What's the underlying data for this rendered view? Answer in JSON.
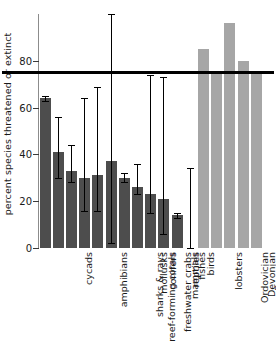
{
  "chart_data": {
    "type": "bar",
    "title": "",
    "xlabel": "",
    "ylabel": "percent species threatened or extinct",
    "ylim": [
      0,
      100
    ],
    "yticks": [
      0,
      20,
      40,
      60,
      80
    ],
    "ytick_labels": [
      "0",
      "20",
      "40",
      "60",
      "80"
    ],
    "grid": false,
    "legend": "none",
    "threshold_line": {
      "value": 75,
      "color": "#000000",
      "label": ""
    },
    "series_colors": {
      "modern_taxa": "#4d4d4d",
      "mass_extinctions": "#a6a6a6"
    },
    "categories": [
      "cycads",
      "amphibians",
      "reef-forming corals",
      "sharks & rays",
      "freshwater crabs",
      "mollusks",
      "conifers",
      "mammals",
      "reptiles",
      "fishes",
      "birds",
      "lobsters",
      "Ordovician",
      "Devonian",
      "Permian",
      "Triassic",
      "Cretaceous"
    ],
    "values": [
      64,
      41,
      33,
      30,
      31,
      37,
      30,
      26,
      23,
      21,
      14,
      0,
      85,
      75,
      96,
      80,
      75
    ],
    "groups": [
      "modern",
      "modern",
      "modern",
      "modern",
      "modern",
      "modern",
      "modern",
      "modern",
      "modern",
      "modern",
      "modern",
      "modern",
      "extinction",
      "extinction",
      "extinction",
      "extinction",
      "extinction"
    ],
    "error_low": [
      63,
      30,
      28,
      16,
      16,
      2,
      28,
      23,
      15,
      6,
      13,
      0,
      null,
      null,
      null,
      null,
      null
    ],
    "error_high": [
      65,
      56,
      44,
      64,
      69,
      100,
      32,
      36,
      74,
      73,
      15,
      34,
      null,
      null,
      null,
      null,
      null
    ]
  }
}
